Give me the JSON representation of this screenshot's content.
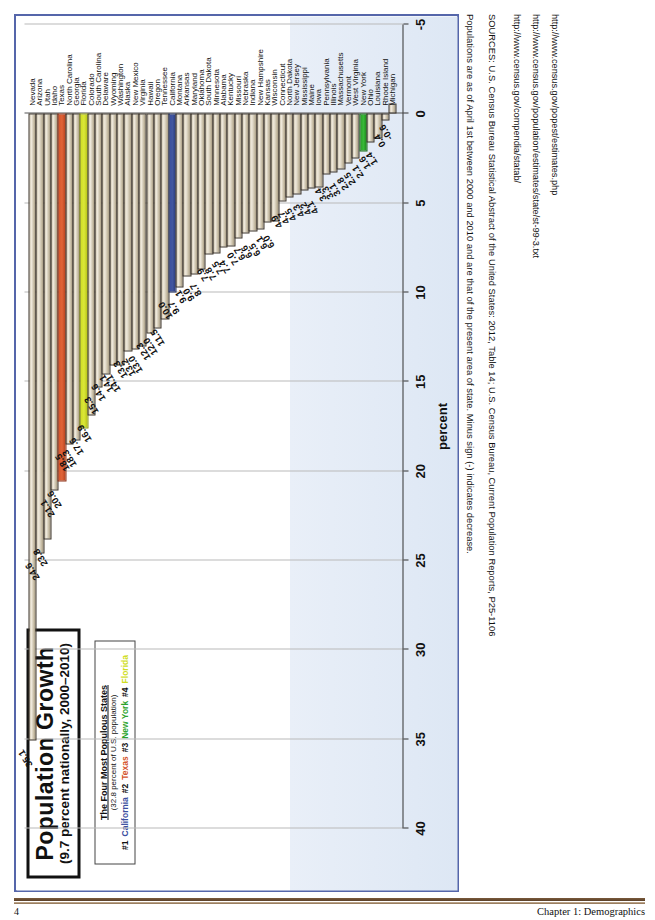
{
  "chart_data": {
    "type": "bar",
    "title": "Population Growth",
    "subtitle": "(9.7 percent nationally, 2000–2010)",
    "xlabel": "",
    "ylabel": "percent",
    "orientation": "vertical-bars-rotated",
    "ylim": [
      -5,
      40
    ],
    "ticks": [
      "40",
      "35",
      "30",
      "25",
      "20",
      "15",
      "10",
      "5",
      "0",
      "-5"
    ],
    "grid": true,
    "legend": {
      "title": "The Four Most Populous States",
      "subtitle": "(32.8 percent of U.S. population)",
      "entries": [
        {
          "rank": "#1",
          "state": "California",
          "color": "#3b4fa0"
        },
        {
          "rank": "#2",
          "state": "Texas",
          "color": "#d4552c"
        },
        {
          "rank": "#3",
          "state": "New York",
          "color": "#2ba32b"
        },
        {
          "rank": "#4",
          "state": "Florida",
          "color": "#cfdd22"
        }
      ]
    },
    "categories": [
      "Nevada",
      "Arizona",
      "Utah",
      "Idaho",
      "Texas",
      "North Carolina",
      "Georgia",
      "Florida",
      "Colorado",
      "South Carolina",
      "Delaware",
      "Wyoming",
      "Washington",
      "Alaska",
      "New Mexico",
      "Virginia",
      "Hawaii",
      "Oregon",
      "Tennessee",
      "California",
      "Montana",
      "Arkansas",
      "Maryland",
      "Oklahoma",
      "South Dakota",
      "Minnesota",
      "Alabama",
      "Kentucky",
      "Missouri",
      "Nebraska",
      "Indiana",
      "New Hampshire",
      "Kansas",
      "Wisconsin",
      "Connecticut",
      "North Dakota",
      "New Jersey",
      "Mississippi",
      "Maine",
      "Iowa",
      "Pennsylvania",
      "Illinois",
      "Massachusetts",
      "Vermont",
      "West Virginia",
      "New York",
      "Ohio",
      "Louisiana",
      "Rhode Island",
      "Michigan"
    ],
    "values": [
      35.1,
      24.6,
      23.8,
      21.1,
      20.6,
      18.5,
      18.3,
      17.6,
      16.9,
      15.3,
      14.6,
      14.1,
      14.1,
      13.3,
      13.2,
      13.0,
      12.3,
      12.0,
      11.5,
      10.0,
      9.7,
      9.1,
      9.0,
      8.7,
      7.9,
      7.8,
      7.5,
      7.4,
      7.0,
      6.7,
      6.6,
      6.5,
      6.1,
      6.0,
      4.9,
      4.7,
      4.5,
      4.3,
      4.2,
      4.1,
      3.4,
      3.3,
      3.1,
      2.8,
      2.5,
      2.1,
      1.6,
      1.4,
      0.4,
      -0.6
    ],
    "highlights": {
      "Texas": "red",
      "Florida": "yellow",
      "California": "blue",
      "New York": "green"
    }
  },
  "notes": {
    "line1": "Populations are as of April 1st between 2000 and 2010 and are that of the present area of state. Minus sign (-) indicates decrease.",
    "line2": "SOURCES: U.S. Census Bureau Statistical Abstract of the United States: 2012, Table 14; U.S. Census Bureau, Current Population Reports, P25-1106",
    "line3": "http://www.census.gov/compendia/statab/",
    "line4": "http://www.census.gov/population/estimates/state/st-99-3.txt",
    "line5": "http://www.census.gov/popest/estimates.php"
  },
  "footer": {
    "page_number": "4",
    "chapter": "Chapter 1: Demographics"
  }
}
